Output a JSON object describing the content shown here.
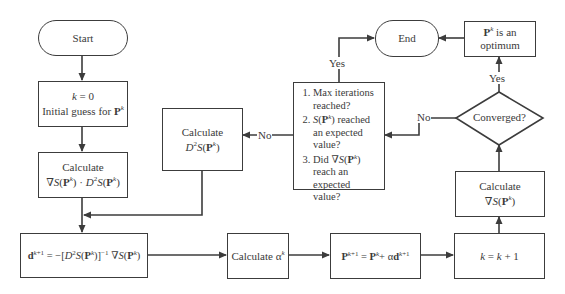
{
  "diagram": {
    "type": "flowchart",
    "nodes": {
      "start": {
        "label": "Start",
        "shape": "terminator"
      },
      "init": {
        "line1": "k = 0",
        "line2": "Initial guess for P^k"
      },
      "calc_grad_hess": {
        "line1": "Calculate",
        "line2": "∇S(P^k) · D²S(P^k)"
      },
      "direction": {
        "label": "d^(k+1) = −[D²S(P^k)]^(−1) ∇S(P^k)"
      },
      "calc_alpha": {
        "label": "Calculate α^k"
      },
      "update": {
        "label": "P^(k+1) = P^k + αd^(k+1)"
      },
      "increment": {
        "label": "k = k + 1"
      },
      "calc_grad": {
        "line1": "Calculate",
        "line2": "∇S(P^k)"
      },
      "converged": {
        "label": "Converged?",
        "shape": "decision"
      },
      "optimum": {
        "line1": "P^k is an",
        "line2": "optimum"
      },
      "end": {
        "label": "End",
        "shape": "terminator"
      },
      "calc_hess": {
        "line1": "Calculate",
        "line2": "D²S(P^k)"
      },
      "stop_criteria": {
        "items": [
          "Max iterations reached?",
          "S(P^k) reached an expected value?",
          "Did ∇S(P^k) reach an expected value?"
        ]
      }
    },
    "edge_labels": {
      "converged_yes": "Yes",
      "converged_no": "No",
      "criteria_yes": "Yes",
      "criteria_no": "No"
    },
    "edges": [
      [
        "start",
        "init"
      ],
      [
        "init",
        "calc_grad_hess"
      ],
      [
        "calc_grad_hess",
        "direction"
      ],
      [
        "calc_hess",
        "direction"
      ],
      [
        "direction",
        "calc_alpha"
      ],
      [
        "calc_alpha",
        "update"
      ],
      [
        "update",
        "increment"
      ],
      [
        "increment",
        "calc_grad"
      ],
      [
        "calc_grad",
        "converged"
      ],
      [
        "converged",
        "optimum",
        "Yes"
      ],
      [
        "optimum",
        "end"
      ],
      [
        "converged",
        "stop_criteria",
        "No"
      ],
      [
        "stop_criteria",
        "end",
        "Yes"
      ],
      [
        "stop_criteria",
        "calc_hess",
        "No"
      ]
    ],
    "colors": {
      "stroke": "#3c3c3c",
      "text": "#3a3a3a",
      "background": "#ffffff"
    }
  }
}
